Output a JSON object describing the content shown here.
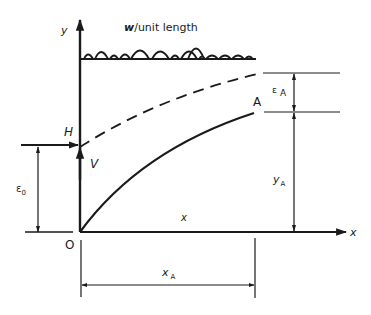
{
  "diagram": {
    "labels": {
      "y_axis": "y",
      "x_axis": "x",
      "load": "w/unit length",
      "horizontal_force": "H",
      "vertical_force": "V",
      "point": "A",
      "origin": "O",
      "curve_x": "x",
      "eps_A": "ε",
      "eps_A_sub": "A",
      "eps_0": "ε",
      "eps_0_sub": "0",
      "y_A": "y",
      "y_A_sub": "A",
      "x_A": "x",
      "x_A_sub": "A"
    },
    "colors": {
      "ink": "#1a1a1a",
      "background": "#ffffff"
    }
  }
}
